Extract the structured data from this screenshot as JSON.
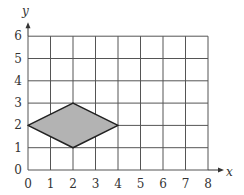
{
  "diagram": {
    "x_axis": {
      "label": "x",
      "ticks": [
        "0",
        "1",
        "2",
        "3",
        "4",
        "5",
        "6",
        "7",
        "8"
      ],
      "min": 0,
      "max": 8
    },
    "y_axis": {
      "label": "y",
      "ticks": [
        "0",
        "1",
        "2",
        "3",
        "4",
        "5",
        "6"
      ],
      "min": 0,
      "max": 6
    },
    "shape": {
      "type": "rhombus",
      "vertices": [
        [
          0,
          2
        ],
        [
          2,
          3
        ],
        [
          4,
          2
        ],
        [
          2,
          1
        ]
      ],
      "fill": "#b3b3b3",
      "stroke": "#222222"
    },
    "grid_color": "#555555"
  }
}
